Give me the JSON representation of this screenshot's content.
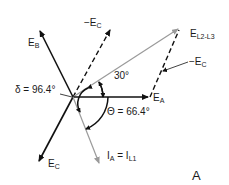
{
  "diagram": {
    "panel_label": "A",
    "colors": {
      "black": "#111111",
      "grey": "#9a9a9a"
    },
    "origin": [
      73,
      97
    ],
    "vectors": [
      {
        "id": "E_B",
        "label": "E",
        "sub": "B",
        "style": "solid",
        "color": "black",
        "tip": [
          39,
          29
        ]
      },
      {
        "id": "neg_E_C_upper",
        "label": "−E",
        "sub": "C",
        "style": "dashed",
        "color": "black",
        "tip": [
          111,
          28
        ]
      },
      {
        "id": "E_L2_L3",
        "label": "E",
        "sub": "L2-L3",
        "style": "solid",
        "color": "grey",
        "tip": [
          180,
          28
        ]
      },
      {
        "id": "E_A",
        "label": "E",
        "sub": "A",
        "style": "solid",
        "color": "black",
        "tip": [
          150,
          97
        ]
      },
      {
        "id": "E_C",
        "label": "E",
        "sub": "C",
        "style": "solid",
        "color": "black",
        "tip": [
          38,
          163
        ]
      },
      {
        "id": "I_A",
        "label": "I",
        "sub": "A",
        "style": "solid",
        "color": "grey",
        "tip": [
          100,
          165
        ]
      }
    ],
    "labels": {
      "e_b": {
        "main": "E",
        "sub": "B"
      },
      "neg_e_c_upper": {
        "main": "−E",
        "sub": "C"
      },
      "e_l2_l3": {
        "main": "E",
        "sub": "L2-L3"
      },
      "neg_e_c_right": {
        "main": "−E",
        "sub": "C"
      },
      "e_a": {
        "main": "E",
        "sub": "A"
      },
      "e_c": {
        "main": "E",
        "sub": "C"
      },
      "i_a": {
        "main": "I",
        "sub": "A",
        "eq": " = I",
        "eq_sub": "L1"
      },
      "delta": "δ = 96.4°",
      "theta": "Θ = 66.4°",
      "angle30": "30°"
    }
  }
}
